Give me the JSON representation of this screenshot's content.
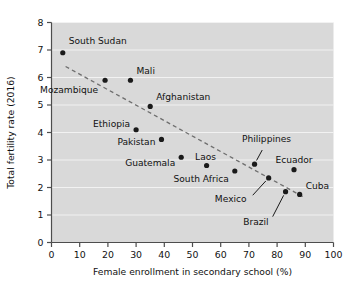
{
  "chart_data": {
    "type": "scatter",
    "title": "",
    "xlabel": "Female enrollment in secondary school (%)",
    "ylabel": "Total fertility rate (2016)",
    "xlim": [
      0,
      100
    ],
    "ylim": [
      0,
      8
    ],
    "xticks": [
      "0",
      "10",
      "20",
      "30",
      "40",
      "50",
      "60",
      "70",
      "80",
      "90",
      "100"
    ],
    "yticks": [
      "0",
      "1",
      "2",
      "3",
      "4",
      "5",
      "6",
      "7",
      "8"
    ],
    "grid": "horizontal",
    "legend": "none",
    "plot_background": "#d9d9d9",
    "gridline_color": "#f2f2f2",
    "point_color": "#1a1a1a",
    "trendline_color": "#6e6e6e",
    "trendline_style": "dashed",
    "trendline": {
      "x_start": 5.0,
      "y_start": 6.4,
      "x_end": 90.0,
      "y_end": 1.62
    },
    "points": [
      {
        "label": "South Sudan",
        "x": 4.0,
        "y": 6.9,
        "label_dx": 6,
        "label_dy": -9,
        "label_anchor": "start",
        "leader": false
      },
      {
        "label": "Mozambique",
        "x": 19.0,
        "y": 5.9,
        "label_dx": -7,
        "label_dy": 13,
        "label_anchor": "end",
        "leader": false
      },
      {
        "label": "Mali",
        "x": 28.0,
        "y": 5.9,
        "label_dx": 6,
        "label_dy": -6,
        "label_anchor": "start",
        "leader": false
      },
      {
        "label": "Afghanistan",
        "x": 35.0,
        "y": 4.95,
        "label_dx": 6,
        "label_dy": -6,
        "label_anchor": "start",
        "leader": false
      },
      {
        "label": "Ethiopia",
        "x": 30.0,
        "y": 4.1,
        "label_dx": -6,
        "label_dy": -3,
        "label_anchor": "end",
        "leader": false
      },
      {
        "label": "Pakistan",
        "x": 39.0,
        "y": 3.75,
        "label_dx": -6,
        "label_dy": 6,
        "label_anchor": "end",
        "leader": false
      },
      {
        "label": "Guatemala",
        "x": 46.0,
        "y": 3.1,
        "label_dx": -6,
        "label_dy": 9,
        "label_anchor": "end",
        "leader": false
      },
      {
        "label": "Laos",
        "x": 55.0,
        "y": 2.8,
        "label_dx": -1,
        "label_dy": -6,
        "label_anchor": "middle",
        "leader": false
      },
      {
        "label": "South Africa",
        "x": 65.0,
        "y": 2.6,
        "label_dx": -6,
        "label_dy": 11,
        "label_anchor": "end",
        "leader": false
      },
      {
        "label": "Philippines",
        "x": 72.0,
        "y": 2.85,
        "label_dx": 12,
        "label_dy": -22,
        "label_anchor": "middle",
        "leader": true
      },
      {
        "label": "Ecuador",
        "x": 86.0,
        "y": 2.65,
        "label_dx": 0,
        "label_dy": -7,
        "label_anchor": "middle",
        "leader": false
      },
      {
        "label": "Mexico",
        "x": 77.0,
        "y": 2.35,
        "label_dx": -22,
        "label_dy": 24,
        "label_anchor": "end",
        "leader": true
      },
      {
        "label": "Brazil",
        "x": 83.0,
        "y": 1.85,
        "label_dx": -17,
        "label_dy": 33,
        "label_anchor": "end",
        "leader": true
      },
      {
        "label": "Cuba",
        "x": 88.0,
        "y": 1.75,
        "label_dx": 6,
        "label_dy": -5,
        "label_anchor": "start",
        "leader": false
      }
    ]
  }
}
